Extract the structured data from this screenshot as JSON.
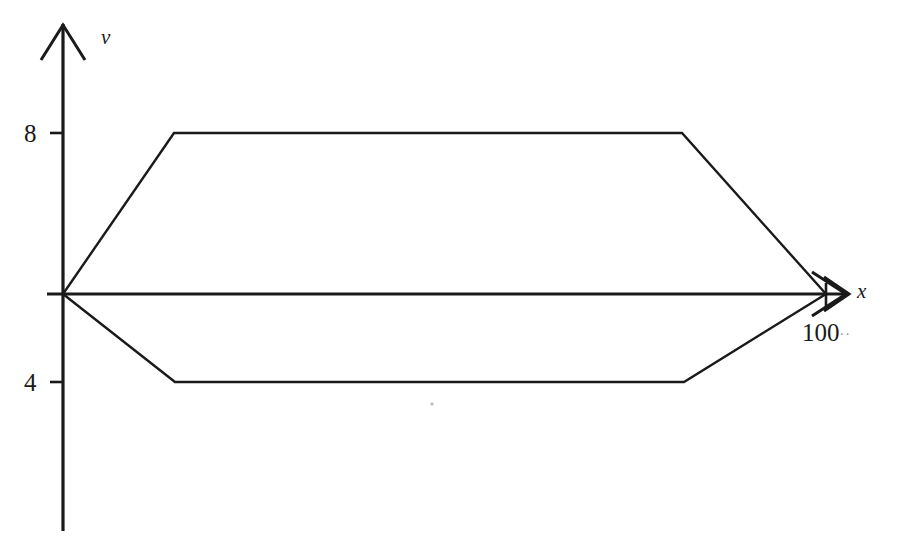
{
  "figure": {
    "background_color": "#ffffff",
    "line_color": "#1a1a1a",
    "axes": {
      "y_axis_label": "v",
      "x_axis_label": "x",
      "y_ticks": [
        {
          "label": "8",
          "value": 8
        },
        {
          "label": "4",
          "value": 4
        }
      ],
      "x_ticks": [
        {
          "label": "100",
          "value": 100,
          "trailing_marks": "··"
        }
      ]
    }
  },
  "chart_data": {
    "type": "line",
    "title": "",
    "subtitle": "",
    "xlabel": "x",
    "ylabel": "v",
    "grid": false,
    "legend": "none",
    "xlim": [
      0,
      115
    ],
    "ylim": [
      0,
      12
    ],
    "axis_style": "arrowed-cartesian-axes",
    "annotations": [
      "Symmetric trapezoidal envelope opening from the origin and closing at x = 100",
      "Upper branch plateaus at v = 8",
      "Lower branch plateaus at v = 4 (drawn below the x-axis baseline)"
    ],
    "series": [
      {
        "name": "upper envelope",
        "x": [
          0,
          14,
          78,
          100
        ],
        "y": [
          0,
          8,
          8,
          0
        ],
        "plateau_value": 8,
        "points_px": [
          [
            63,
            294
          ],
          [
            174,
            133
          ],
          [
            682,
            133
          ],
          [
            826,
            294
          ]
        ]
      },
      {
        "name": "lower envelope",
        "x": [
          0,
          14,
          78,
          100
        ],
        "y": [
          0,
          -4,
          -4,
          0
        ],
        "plateau_value": 4,
        "points_px": [
          [
            63,
            294
          ],
          [
            175,
            382
          ],
          [
            684,
            382
          ],
          [
            826,
            294
          ]
        ]
      }
    ]
  }
}
